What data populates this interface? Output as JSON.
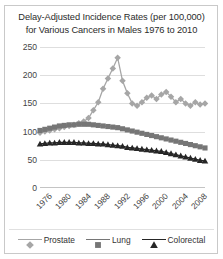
{
  "chart_data": {
    "type": "line",
    "title": "Delay-Adjusted Incidence Rates  (per 100,000) for Various  Cancers in Males 1976 to 2010",
    "title_line1": "Delay-Adjusted Incidence Rates  (per 100,000)",
    "title_line2": "for Various  Cancers in Males 1976 to 2010",
    "xlabel": "",
    "ylabel": "",
    "ylim": [
      0,
      250
    ],
    "xlim": [
      1976,
      2010
    ],
    "grid": true,
    "legend_position": "bottom",
    "y_ticks": [
      250,
      200,
      150,
      100,
      50,
      0
    ],
    "x_ticks": [
      1976,
      1980,
      1984,
      1988,
      1992,
      1996,
      2000,
      2004,
      2008
    ],
    "x": [
      1976,
      1977,
      1978,
      1979,
      1980,
      1981,
      1982,
      1983,
      1984,
      1985,
      1986,
      1987,
      1988,
      1989,
      1990,
      1991,
      1992,
      1993,
      1994,
      1995,
      1996,
      1997,
      1998,
      1999,
      2000,
      2001,
      2002,
      2003,
      2004,
      2005,
      2006,
      2007,
      2008,
      2009,
      2010
    ],
    "series": [
      {
        "name": "Prostate",
        "marker": "diamond",
        "color": "#a6a6a6",
        "values": [
          98,
          100,
          102,
          104,
          106,
          108,
          110,
          112,
          115,
          118,
          124,
          138,
          152,
          176,
          194,
          212,
          231,
          190,
          168,
          150,
          146,
          152,
          160,
          164,
          158,
          166,
          170,
          162,
          152,
          158,
          150,
          146,
          152,
          148,
          150
        ]
      },
      {
        "name": "Lung",
        "marker": "square",
        "color": "#767676",
        "values": [
          102,
          104,
          106,
          108,
          110,
          111,
          112,
          112,
          113,
          113,
          113,
          112,
          111,
          110,
          109,
          108,
          107,
          105,
          103,
          101,
          99,
          97,
          95,
          93,
          91,
          89,
          87,
          85,
          83,
          81,
          79,
          77,
          75,
          73,
          71
        ]
      },
      {
        "name": "Colorectal",
        "marker": "triangle",
        "color": "#262626",
        "values": [
          78,
          79,
          80,
          80,
          81,
          81,
          81,
          81,
          80,
          80,
          79,
          79,
          78,
          78,
          77,
          76,
          75,
          74,
          72,
          71,
          70,
          69,
          68,
          67,
          66,
          65,
          63,
          61,
          59,
          57,
          55,
          53,
          51,
          49,
          48
        ]
      }
    ]
  },
  "legend": {
    "items": [
      {
        "label": "Prostate",
        "marker": "diamond-marker-icon",
        "color": "#a6a6a6"
      },
      {
        "label": "Lung",
        "marker": "square-marker-icon",
        "color": "#767676"
      },
      {
        "label": "Colorectal",
        "marker": "triangle-marker-icon",
        "color": "#262626"
      }
    ]
  },
  "colors": {
    "gridline": "#dedede",
    "axis": "#c4c4c4",
    "text": "#333333",
    "background": "#ffffff",
    "border": "#c9c9c9"
  }
}
